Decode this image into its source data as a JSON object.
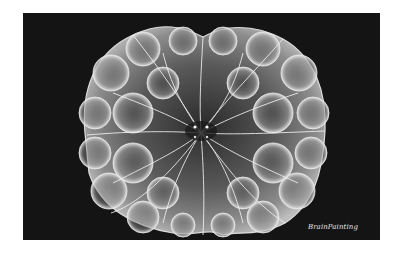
{
  "artwork": {
    "description": "Grayscale 3D fractal (Mandelbulb-like) rendered as a glowing white web of bubbles on a black background",
    "background_color": "#141414",
    "page_color": "#ffffff",
    "fractal_color": "#e6e6e6",
    "signature": "BrainPainting"
  }
}
